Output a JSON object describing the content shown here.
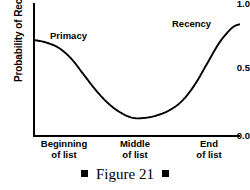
{
  "figure": {
    "caption_text": "Figure 21",
    "bullet_glyph": "filled-square"
  },
  "chart_data": {
    "type": "line",
    "title": "",
    "xlabel": "",
    "ylabel": "Probability of Recall",
    "xlim": [
      0,
      1
    ],
    "ylim": [
      0.0,
      1.0
    ],
    "grid": false,
    "legend": "none",
    "y_ticks": [
      "0.0",
      "0.5",
      "1.0"
    ],
    "y_tick_values": [
      0.0,
      0.5,
      1.0
    ],
    "x_ticks": [
      {
        "line1": "Beginning",
        "line2": "of list",
        "position": 0.0
      },
      {
        "line1": "Middle",
        "line2": "of list",
        "position": 0.5
      },
      {
        "line1": "End",
        "line2": "of list",
        "position": 1.0
      }
    ],
    "annotations": [
      {
        "label": "Primacy",
        "x": 0.16,
        "y": 0.78
      },
      {
        "label": "Recency",
        "x": 0.78,
        "y": 0.88
      }
    ],
    "series": [
      {
        "name": "serial position curve",
        "color": "#000000",
        "x": [
          0.0,
          0.06,
          0.12,
          0.18,
          0.24,
          0.3,
          0.36,
          0.42,
          0.48,
          0.54,
          0.6,
          0.66,
          0.72,
          0.78,
          0.84,
          0.9,
          0.96,
          1.0
        ],
        "y": [
          0.72,
          0.7,
          0.66,
          0.58,
          0.46,
          0.34,
          0.24,
          0.17,
          0.13,
          0.13,
          0.15,
          0.19,
          0.26,
          0.38,
          0.54,
          0.7,
          0.81,
          0.84
        ]
      }
    ]
  },
  "axis_titles": {
    "y": "Probability of Recall"
  }
}
